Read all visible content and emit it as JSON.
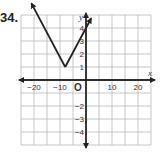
{
  "problem": {
    "number": "34."
  },
  "chart_data": {
    "type": "line",
    "title": "",
    "xlabel": "x",
    "ylabel": "y",
    "origin_label": "O",
    "xlim": [
      -25,
      25
    ],
    "ylim": [
      -5,
      5
    ],
    "grid": true,
    "x_grid_step": 5,
    "y_grid_step": 1,
    "x_tick_labels": [
      "-20",
      "-10",
      "10",
      "20"
    ],
    "x_tick_values": [
      -20,
      -10,
      10,
      20
    ],
    "y_tick_labels": [
      "4",
      "3",
      "2",
      "1",
      "-2",
      "-3",
      "-4"
    ],
    "y_tick_values": [
      4,
      3,
      2,
      1,
      -2,
      -3,
      -4
    ],
    "series": [
      {
        "name": "absolute value function",
        "equation": "y = (3/8)|x + 8| + 1",
        "vertex": [
          -8,
          1
        ],
        "x": [
          -21,
          -8,
          2
        ],
        "y": [
          5.9,
          1,
          4.75
        ],
        "arrows": "both ends"
      }
    ],
    "colors": {
      "grid": "#b8b8b8",
      "axis": "#222222",
      "line": "#222222"
    }
  }
}
